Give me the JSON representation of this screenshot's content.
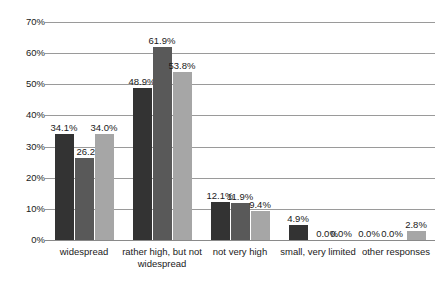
{
  "chart_data": {
    "type": "bar",
    "title": "",
    "subtitle": "",
    "xlabel": "",
    "ylabel": "",
    "ylim": [
      0,
      70
    ],
    "ytick_labels": [
      "0%",
      "10%",
      "20%",
      "30%",
      "40%",
      "50%",
      "60%",
      "70%"
    ],
    "ytick_values": [
      0,
      10,
      20,
      30,
      40,
      50,
      60,
      70
    ],
    "grid": true,
    "legend": "none",
    "categories": [
      "widespread",
      "rather high, but not\nwidespread",
      "not very high",
      "small, very limited",
      "other responses"
    ],
    "series": [
      {
        "name": "series-1",
        "color": "#333333",
        "values": [
          34.1,
          48.9,
          12.1,
          4.9,
          0.0
        ],
        "labels": [
          "34.1%",
          "48.9%",
          "12.1%",
          "4.9%",
          "0.0%"
        ]
      },
      {
        "name": "series-2",
        "color": "#595959",
        "values": [
          26.2,
          61.9,
          11.9,
          0.0,
          0.0
        ],
        "labels": [
          "26.2%",
          "61.9%",
          "11.9%",
          "0.0%",
          "0.0%"
        ]
      },
      {
        "name": "series-3",
        "color": "#a6a6a6",
        "values": [
          34.0,
          53.8,
          9.4,
          0.0,
          2.8
        ],
        "labels": [
          "34.0%",
          "53.8%",
          "9.4%",
          "0.0%",
          "2.8%"
        ]
      }
    ]
  },
  "colors": {
    "series_1": "#333333",
    "series_2": "#595959",
    "series_3": "#a6a6a6",
    "gridline": "#9a9a9a",
    "text": "#1a1a1a",
    "background": "#ffffff"
  }
}
